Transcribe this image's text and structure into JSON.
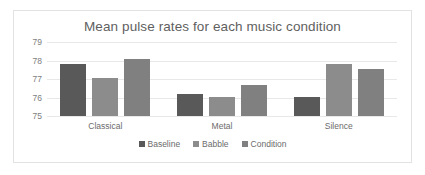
{
  "chart_data": {
    "type": "bar",
    "title": "Mean pulse rates for each music condition",
    "xlabel": "",
    "ylabel": "",
    "categories": [
      "Classical",
      "Metal",
      "Silence"
    ],
    "series": [
      {
        "name": "Baseline",
        "color": "#595959",
        "values": [
          77.8,
          76.2,
          76.05
        ]
      },
      {
        "name": "Babble",
        "color": "#8c8c8c",
        "values": [
          77.05,
          76.05,
          77.8
        ]
      },
      {
        "name": "Condition",
        "color": "#808080",
        "values": [
          78.1,
          76.7,
          77.55
        ]
      }
    ],
    "ylim": [
      75,
      79
    ],
    "yticks": [
      79,
      78,
      77,
      76,
      75
    ],
    "ytick_labels": [
      "79",
      "78",
      "77",
      "76",
      "75"
    ],
    "grid": true,
    "legend_position": "bottom"
  },
  "colors": {
    "title_text": "#5f5f5f",
    "axis_text": "#7d7d7d",
    "gridline": "#e8e8e8",
    "border": "#e2e2e2",
    "background": "#ffffff"
  }
}
